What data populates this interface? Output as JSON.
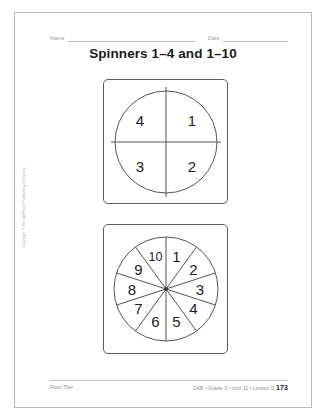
{
  "page": {
    "title": "Spinners 1–4 and 1–10",
    "copyright": "Copyright © Kendall/Hunt Publishing Company"
  },
  "header": {
    "name_label": "Name",
    "date_label": "Date"
  },
  "spinners": [
    {
      "id": "spinner-1-4",
      "name": "quarters-spinner",
      "sector_count": 4,
      "labels": [
        "1",
        "2",
        "3",
        "4"
      ],
      "order": "clockwise-from-top",
      "range": "1–4"
    },
    {
      "id": "spinner-1-10",
      "name": "tenths-spinner",
      "sector_count": 10,
      "labels": [
        "1",
        "2",
        "3",
        "4",
        "5",
        "6",
        "7",
        "8",
        "9",
        "10"
      ],
      "order": "clockwise-from-top",
      "range": "1–10"
    }
  ],
  "footer": {
    "left": "Floor Tiler",
    "right": "DAB • Grade 3 • Unit 11 • Lesson 5",
    "page_number": "173"
  },
  "colors": {
    "ink": "#1b1b1b",
    "rule": "#bdbdbd",
    "stroke": "#555555",
    "muted": "#9a9a9a"
  }
}
